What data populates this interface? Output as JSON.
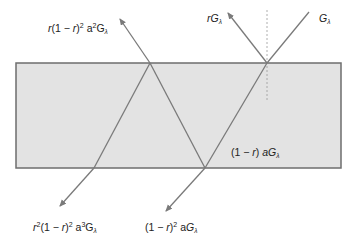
{
  "diagram": {
    "title": "",
    "colors": {
      "slab_fill": "#e3e3e3",
      "slab_border": "#6e6e6e",
      "ray": "#7a7a7a",
      "normal": "#9a9a9a",
      "text": "#222222"
    },
    "slab": {
      "x": 16,
      "y": 63,
      "width": 325,
      "height": 105
    },
    "normal_line": {
      "x": 267,
      "y1": 10,
      "y2": 100,
      "style": "dotted"
    },
    "rays": [
      {
        "id": "incident",
        "x1": 309,
        "y1": 12,
        "x2": 267,
        "y2": 63,
        "arrow": false,
        "label_id": "G"
      },
      {
        "id": "reflected-1",
        "x1": 267,
        "y1": 63,
        "x2": 228,
        "y2": 13,
        "arrow": true,
        "label_id": "rG"
      },
      {
        "id": "internal-1",
        "x1": 267,
        "y1": 63,
        "x2": 205,
        "y2": 168,
        "arrow": false
      },
      {
        "id": "internal-2",
        "x1": 205,
        "y1": 168,
        "x2": 150,
        "y2": 63,
        "arrow": false
      },
      {
        "id": "internal-3",
        "x1": 150,
        "y1": 63,
        "x2": 94,
        "y2": 168,
        "arrow": false
      },
      {
        "id": "transmitted-1",
        "x1": 205,
        "y1": 168,
        "x2": 166,
        "y2": 211,
        "arrow": true,
        "label_id": "T1"
      },
      {
        "id": "emerging-top",
        "x1": 150,
        "y1": 63,
        "x2": 120,
        "y2": 19,
        "arrow": true,
        "label_id": "R2"
      },
      {
        "id": "transmitted-2",
        "x1": 94,
        "y1": 168,
        "x2": 60,
        "y2": 206,
        "arrow": true,
        "label_id": "T2"
      }
    ],
    "labels": {
      "G": {
        "base": "G",
        "sub": "λ"
      },
      "rG": {
        "r": "r",
        "base": "G",
        "sub": "λ"
      },
      "R2": {
        "r": "r",
        "open": "(1 − ",
        "r2": "r",
        "close": ")",
        "exp1": "2",
        "a": " a",
        "exp2": "2",
        "base": "G",
        "sub": "λ"
      },
      "inner": {
        "open": "(1 − ",
        "r": "r",
        "close": ") ",
        "a": "a",
        "base": "G",
        "sub": "λ"
      },
      "T1": {
        "open": "(1 − ",
        "r": "r",
        "close": ")",
        "exp1": "2",
        "a": " a",
        "base": "G",
        "sub": "λ"
      },
      "T2": {
        "r": "r",
        "exp0": "2",
        "open": "(1 − ",
        "r2": "r",
        "close": ")",
        "exp1": "2",
        "a": " a",
        "exp2": "3",
        "base": "G",
        "sub": "λ"
      }
    }
  }
}
